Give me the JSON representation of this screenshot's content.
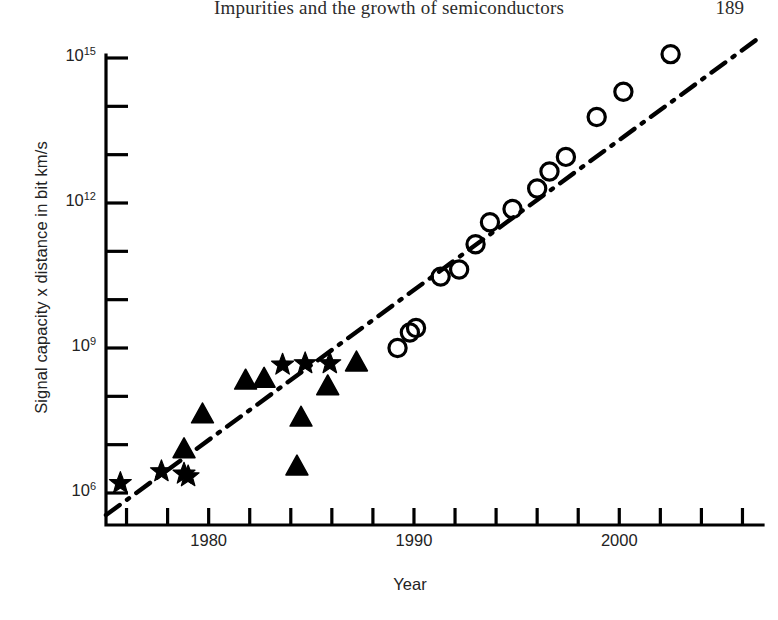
{
  "page": {
    "running_head": "Impurities and the growth of semiconductors",
    "folio": "189"
  },
  "chart_data": {
    "type": "scatter",
    "title": "",
    "xlabel": "Year",
    "ylabel": "Signal capacity x distance in bit km/s",
    "xlim": [
      1975,
      2007
    ],
    "ylim": [
      1000000.0,
      3000000000000000.0
    ],
    "yscale": "log",
    "grid": false,
    "legend": "none",
    "x_ticks": [
      1976,
      1978,
      1980,
      1982,
      1984,
      1986,
      1988,
      1990,
      1992,
      1994,
      1996,
      1998,
      2000,
      2002,
      2004,
      2006
    ],
    "x_tick_labels": [
      "",
      "",
      "1980",
      "",
      "",
      "",
      "",
      "1990",
      "",
      "",
      "",
      "",
      "2000",
      "",
      "",
      ""
    ],
    "y_ticks": [
      1000000.0,
      10000000.0,
      100000000.0,
      1000000000.0,
      10000000000.0,
      100000000000.0,
      1000000000000.0,
      10000000000000.0,
      100000000000000.0,
      1000000000000000.0
    ],
    "y_tick_labels": [
      "10",
      "",
      "",
      "10",
      "",
      "",
      "10",
      "",
      "",
      "10"
    ],
    "y_tick_exponents": [
      "6",
      "",
      "",
      "9",
      "",
      "",
      "12",
      "",
      "",
      "15"
    ],
    "series": [
      {
        "name": "star-series",
        "marker": "star",
        "color": "#000000",
        "points": [
          {
            "x": 1975.7,
            "y": 1600000.0
          },
          {
            "x": 1977.7,
            "y": 2800000.0
          },
          {
            "x": 1978.8,
            "y": 2500000.0
          },
          {
            "x": 1979.0,
            "y": 2200000.0
          },
          {
            "x": 1983.6,
            "y": 450000000.0
          },
          {
            "x": 1984.7,
            "y": 480000000.0
          },
          {
            "x": 1985.9,
            "y": 480000000.0
          }
        ]
      },
      {
        "name": "triangle-series",
        "marker": "triangle",
        "color": "#000000",
        "points": [
          {
            "x": 1978.8,
            "y": 8000000.0
          },
          {
            "x": 1979.7,
            "y": 42000000.0
          },
          {
            "x": 1981.8,
            "y": 210000000.0
          },
          {
            "x": 1982.7,
            "y": 230000000.0
          },
          {
            "x": 1984.3,
            "y": 3500000.0
          },
          {
            "x": 1984.5,
            "y": 36000000.0
          },
          {
            "x": 1985.8,
            "y": 160000000.0
          },
          {
            "x": 1987.2,
            "y": 500000000.0
          }
        ]
      },
      {
        "name": "circle-series",
        "marker": "circle",
        "color": "#000000",
        "points": [
          {
            "x": 1989.2,
            "y": 1000000000.0
          },
          {
            "x": 1989.8,
            "y": 2100000000.0
          },
          {
            "x": 1990.1,
            "y": 2600000000.0
          },
          {
            "x": 1991.3,
            "y": 30000000000.0
          },
          {
            "x": 1992.2,
            "y": 42000000000.0
          },
          {
            "x": 1993.0,
            "y": 140000000000.0
          },
          {
            "x": 1993.7,
            "y": 400000000000.0
          },
          {
            "x": 1994.8,
            "y": 750000000000.0
          },
          {
            "x": 1996.0,
            "y": 2000000000000.0
          },
          {
            "x": 1996.6,
            "y": 4500000000000.0
          },
          {
            "x": 1997.4,
            "y": 9000000000000.0
          },
          {
            "x": 1998.9,
            "y": 60000000000000.0
          },
          {
            "x": 2000.2,
            "y": 200000000000000.0
          },
          {
            "x": 2002.5,
            "y": 1200000000000000.0
          }
        ]
      }
    ],
    "trend_line": {
      "name": "dash-dot trend",
      "style": "dash-dot",
      "color": "#000000",
      "from": {
        "x": 1975.0,
        "y": 350000.0
      },
      "to": {
        "x": 2006.8,
        "y": 2600000000000000.0
      }
    },
    "annotations": []
  }
}
